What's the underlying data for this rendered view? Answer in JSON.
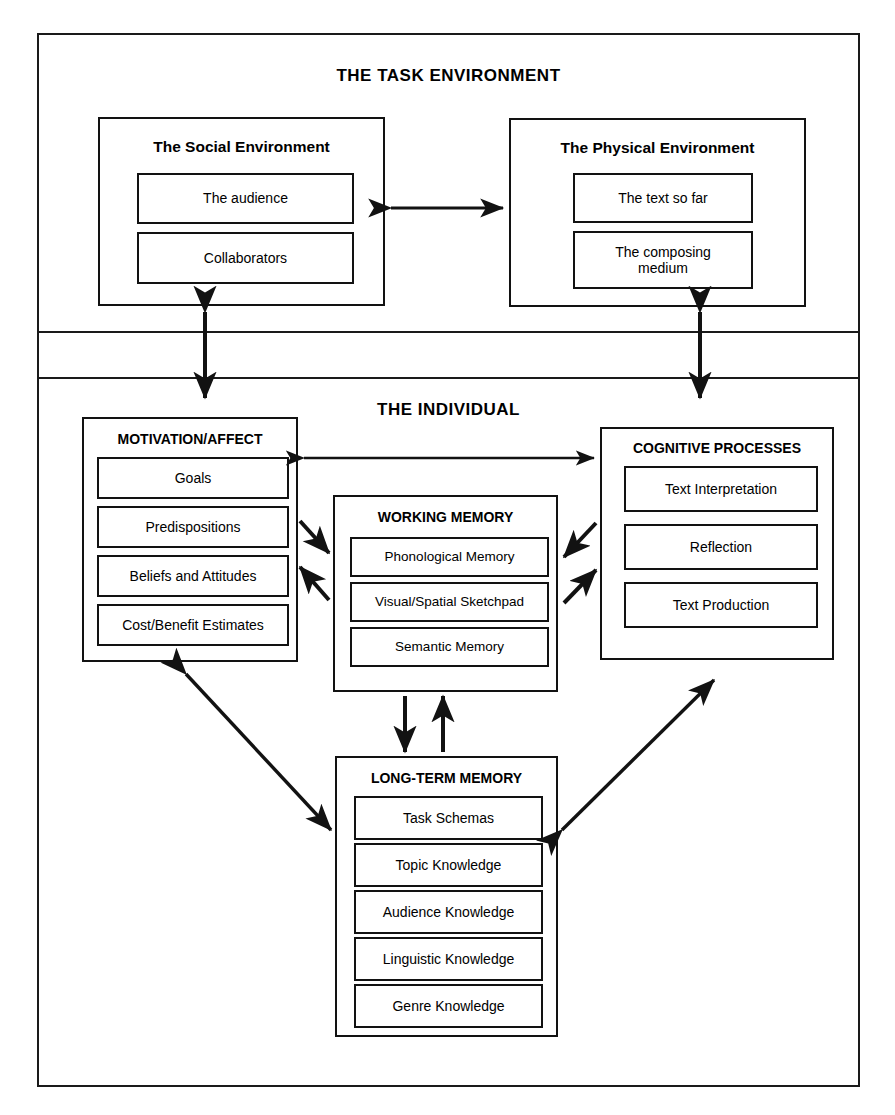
{
  "diagram": {
    "title_task_environment": "THE TASK ENVIRONMENT",
    "title_individual": "THE INDIVIDUAL"
  },
  "task_environment": {
    "social": {
      "title": "The Social Environment",
      "items": [
        "The  audience",
        "Collaborators"
      ]
    },
    "physical": {
      "title": "The Physical Environment",
      "items": [
        "The text so far",
        "The composing\nmedium"
      ],
      "item1": "The text so far",
      "item2_line1": "The composing",
      "item2_line2": "medium"
    }
  },
  "individual": {
    "motivation": {
      "title": "MOTIVATION/AFFECT",
      "items": [
        "Goals",
        "Predispositions",
        "Beliefs and Attitudes",
        "Cost/Benefit Estimates"
      ]
    },
    "working_memory": {
      "title": "WORKING MEMORY",
      "items": [
        "Phonological Memory",
        "Visual/Spatial Sketchpad",
        "Semantic Memory"
      ]
    },
    "cognitive": {
      "title": "COGNITIVE PROCESSES",
      "items": [
        "Text Interpretation",
        "Reflection",
        "Text Production"
      ]
    },
    "long_term_memory": {
      "title": "LONG-TERM MEMORY",
      "items": [
        "Task Schemas",
        "Topic Knowledge",
        "Audience Knowledge",
        "Linguistic Knowledge",
        "Genre Knowledge"
      ]
    }
  },
  "colors": {
    "ink": "#121212",
    "paper": "#ffffff"
  }
}
